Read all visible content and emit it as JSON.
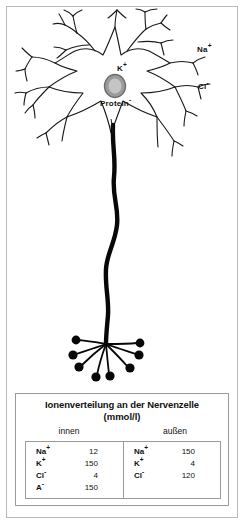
{
  "figure": {
    "diagram": {
      "alt_name": "nerve-cell-ion-distribution-diagram",
      "labels": {
        "extracellular_sodium": "Na",
        "extracellular_sodium_charge": "+",
        "extracellular_chloride": "Cl",
        "extracellular_chloride_charge": "-",
        "intracellular_potassium": "K",
        "intracellular_potassium_charge": "+",
        "intracellular_protein": "Protein",
        "intracellular_protein_charge": "-"
      }
    },
    "table": {
      "title": "Ionenverteilung an der Nervenzelle",
      "units": "(mmol/l)",
      "columns": [
        {
          "header": "innen",
          "rows": [
            {
              "ion": "Na",
              "charge": "+",
              "value": "12"
            },
            {
              "ion": "K",
              "charge": "+",
              "value": "150"
            },
            {
              "ion": "Cl",
              "charge": "-",
              "value": "4"
            },
            {
              "ion": "A",
              "charge": "-",
              "value": "150"
            }
          ]
        },
        {
          "header": "außen",
          "rows": [
            {
              "ion": "Na",
              "charge": "+",
              "value": "150"
            },
            {
              "ion": "K",
              "charge": "+",
              "value": "4"
            },
            {
              "ion": "Cl",
              "charge": "-",
              "value": "120"
            }
          ]
        }
      ]
    },
    "colors": {
      "frame": "#b9b9b9",
      "table_border": "#9a9a9a",
      "ink": "#111111",
      "nucleus_fill": "#9b9b9b",
      "nucleus_ring": "#6d6d6d",
      "background": "#ffffff"
    }
  }
}
